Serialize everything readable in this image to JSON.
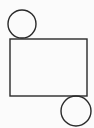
{
  "diagram": {
    "background": "#fbfbfb",
    "stroke": "#2a2a2a",
    "shapes": {
      "rectangle": {
        "x": 10,
        "y": 39,
        "width": 77,
        "height": 57
      },
      "top_circle": {
        "cx": 22,
        "cy": 24,
        "r": 14
      },
      "bottom_circle": {
        "cx": 76,
        "cy": 111,
        "r": 15
      }
    }
  }
}
